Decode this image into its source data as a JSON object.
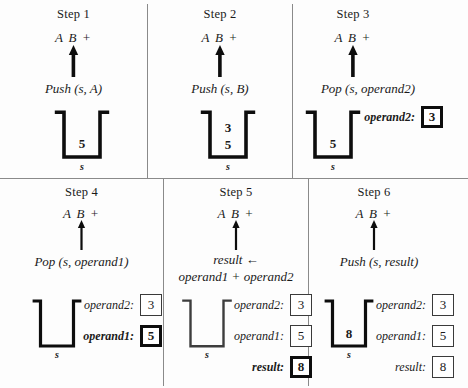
{
  "figure": {
    "background_color": "#fdfdfd",
    "line_color": "#0d0d0d",
    "divider_color": "#8a8a8a"
  },
  "steps": [
    {
      "title": "Step 1",
      "expression": "A B +",
      "operation": "Push (s, A)",
      "operation_line2": "",
      "stack": {
        "name": "s",
        "values": [
          "5"
        ]
      },
      "variables": []
    },
    {
      "title": "Step 2",
      "expression": "A B +",
      "operation": "Push (s, B)",
      "operation_line2": "",
      "stack": {
        "name": "s",
        "values": [
          "3",
          "5"
        ]
      },
      "variables": []
    },
    {
      "title": "Step 3",
      "expression": "A B +",
      "operation": "Pop (s, operand2)",
      "operation_line2": "",
      "stack": {
        "name": "s",
        "values": [
          "5"
        ]
      },
      "variables": [
        {
          "label": "operand2:",
          "value": "3",
          "emphasis": true
        }
      ]
    },
    {
      "title": "Step 4",
      "expression": "A B +",
      "operation": "Pop (s, operand1)",
      "operation_line2": "",
      "stack": {
        "name": "s",
        "values": []
      },
      "variables": [
        {
          "label": "operand2:",
          "value": "3",
          "emphasis": false
        },
        {
          "label": "operand1:",
          "value": "5",
          "emphasis": true
        }
      ]
    },
    {
      "title": "Step 5",
      "expression": "A B +",
      "operation": "result ←",
      "operation_line2": "operand1 + operand2",
      "stack": {
        "name": "s",
        "values": []
      },
      "variables": [
        {
          "label": "operand2:",
          "value": "3",
          "emphasis": false
        },
        {
          "label": "operand1:",
          "value": "5",
          "emphasis": false
        },
        {
          "label": "result:",
          "value": "8",
          "emphasis": true
        }
      ]
    },
    {
      "title": "Step 6",
      "expression": "A B +",
      "operation": "Push (s, result)",
      "operation_line2": "",
      "stack": {
        "name": "s",
        "values": [
          "8"
        ]
      },
      "variables": [
        {
          "label": "operand2:",
          "value": "3",
          "emphasis": false
        },
        {
          "label": "operand1:",
          "value": "5",
          "emphasis": false
        },
        {
          "label": "result:",
          "value": "8",
          "emphasis": false
        }
      ]
    }
  ]
}
